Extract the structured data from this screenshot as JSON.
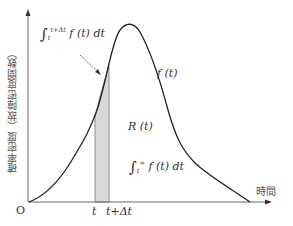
{
  "figure": {
    "y_axis_label": "確率密度（故障密度関数）",
    "x_axis_label": "時間",
    "origin_label": "O",
    "curve_label": "f (t)",
    "region_label": "R (t)",
    "t_tick": "t",
    "t_dt_tick": "t+Δt",
    "integral_strip": {
      "sign": "∫",
      "lower": "t",
      "upper": "t+Δt",
      "body": "f (t) dt"
    },
    "integral_tail": {
      "sign": "∫",
      "lower": "t",
      "upper": "∞",
      "body": "f (t) dt"
    },
    "colors": {
      "axis": "#555555",
      "curve": "#222222",
      "shade": "#d9d9d9",
      "strip_edge": "#777777"
    }
  }
}
